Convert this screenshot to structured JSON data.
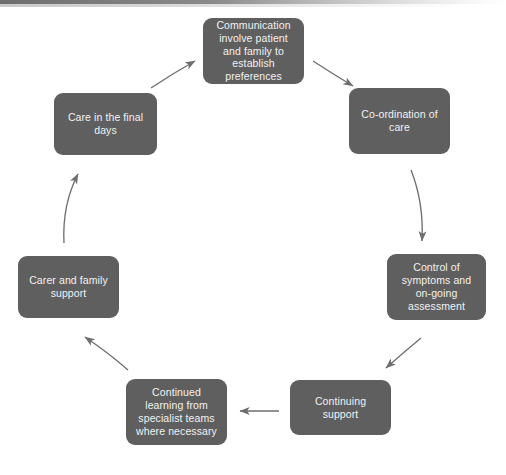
{
  "diagram": {
    "type": "cycle",
    "background_color": "#ffffff",
    "node_color": "#5f5f5f",
    "node_text_color": "#f2f2f2",
    "arrow_color": "#6e6e6e",
    "top_band_color": "#6d6d6d",
    "nodes": [
      {
        "id": "communication",
        "label": "Communication involve patient and family to establish preferences",
        "order": 1
      },
      {
        "id": "coordination",
        "label": "Co-ordination of care",
        "order": 2
      },
      {
        "id": "control",
        "label": "Control of symptoms and on-going assessment",
        "order": 3
      },
      {
        "id": "continuing",
        "label": "Continuing support",
        "order": 4
      },
      {
        "id": "learning",
        "label": "Continued learning from specialist teams where necessary",
        "order": 5
      },
      {
        "id": "carer",
        "label": "Carer and family support",
        "order": 6
      },
      {
        "id": "final_days",
        "label": "Care in the final days",
        "order": 7
      }
    ],
    "arrows": [
      {
        "id": "arrow-communication-to-coordination",
        "from": "communication",
        "to": "coordination",
        "direction": "down-right"
      },
      {
        "id": "arrow-coordination-to-control",
        "from": "coordination",
        "to": "control",
        "direction": "down"
      },
      {
        "id": "arrow-control-to-continuing",
        "from": "control",
        "to": "continuing",
        "direction": "down-left"
      },
      {
        "id": "arrow-continuing-to-learning",
        "from": "continuing",
        "to": "learning",
        "direction": "left"
      },
      {
        "id": "arrow-learning-to-carer",
        "from": "learning",
        "to": "carer",
        "direction": "up-left"
      },
      {
        "id": "arrow-carer-to-final-days",
        "from": "carer",
        "to": "final_days",
        "direction": "up"
      },
      {
        "id": "arrow-final-days-to-communication",
        "from": "final_days",
        "to": "communication",
        "direction": "up-right"
      }
    ]
  }
}
